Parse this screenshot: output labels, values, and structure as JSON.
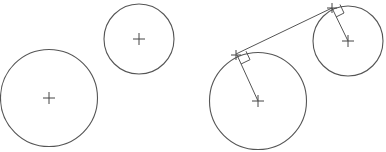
{
  "diagram": {
    "width": 386,
    "height": 152,
    "colors": {
      "background": "#ffffff",
      "stroke": "#555555",
      "marker": "#444444"
    },
    "panels": [
      {
        "name": "left-panel",
        "circles": [
          {
            "name": "small-circle",
            "cx": 139,
            "cy": 39,
            "r": 35
          },
          {
            "name": "large-circle",
            "cx": 49,
            "cy": 98,
            "r": 48.5
          }
        ],
        "tangent": null
      },
      {
        "name": "right-panel",
        "circles": [
          {
            "name": "large-circle",
            "cx": 258,
            "cy": 101,
            "r": 48.5
          },
          {
            "name": "small-circle",
            "cx": 348,
            "cy": 41,
            "r": 35
          }
        ],
        "tangent": {
          "line": {
            "x1": 236,
            "y1": 54,
            "x2": 332,
            "y2": 8
          },
          "points": [
            {
              "name": "tangent-point-large",
              "x": 236,
              "y": 55
            },
            {
              "name": "tangent-point-small",
              "x": 332,
              "y": 8
            }
          ],
          "radii": [
            {
              "name": "radius-large",
              "x1": 258,
              "y1": 101,
              "x2": 237,
              "y2": 55
            },
            {
              "name": "radius-small",
              "x1": 348,
              "y1": 41,
              "x2": 332,
              "y2": 8
            }
          ],
          "right_angle_markers": [
            {
              "name": "right-angle-large",
              "path": "M241,64 L250,59.7 L246,51.2"
            },
            {
              "name": "right-angle-small",
              "path": "M336,17 L344,13 L340,4.5"
            }
          ]
        }
      }
    ],
    "center_mark_size": 6,
    "tangent_mark_size": 5
  }
}
